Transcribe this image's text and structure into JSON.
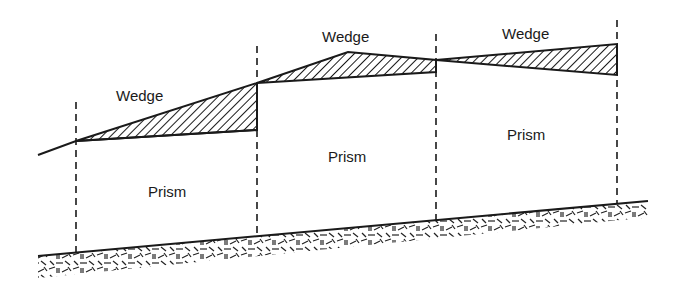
{
  "diagram": {
    "type": "earthwork-cross-section",
    "labels": {
      "wedge_1": "Wedge",
      "wedge_2": "Wedge",
      "wedge_3": "Wedge",
      "prism_1": "Prism",
      "prism_2": "Prism",
      "prism_3": "Prism"
    },
    "colors": {
      "line": "#1a1a1a",
      "background": "#ffffff"
    }
  }
}
